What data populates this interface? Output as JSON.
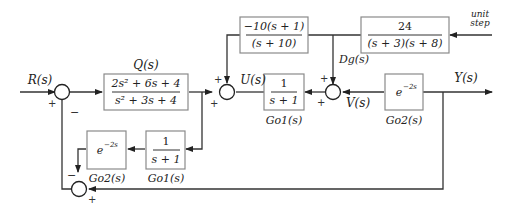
{
  "blocks": {
    "Q": {
      "label": "Q(s)",
      "num": "2s² + 6s + 4",
      "den": "s² + 3s + 4"
    },
    "K": {
      "num": "−10(s + 1)",
      "den": "(s + 10)"
    },
    "D": {
      "num": "24",
      "den": "(s + 3)(s + 8)"
    },
    "Go1_main": {
      "num": "1",
      "den": "s + 1",
      "label": "Go1(s)"
    },
    "Go2_main": {
      "expr": "e^{−2s}",
      "base": "e",
      "exp": "−2s",
      "label": "Go2(s)"
    },
    "Go1_model": {
      "num": "1",
      "den": "s + 1",
      "label": "Go1(s)"
    },
    "Go2_model": {
      "expr": "e^{−2s}",
      "base": "e",
      "exp": "−2s",
      "label": "Go2(s)"
    }
  },
  "signals": {
    "input": "R(s)",
    "control": "U(s)",
    "disturbance": "Dg(s)",
    "internal": "V(s)",
    "output": "Y(s)",
    "disturbance_source_line1": "unit",
    "disturbance_source_line2": "step"
  },
  "summing_junctions": {
    "S1": {
      "signs": [
        "+",
        "−"
      ]
    },
    "S2": {
      "signs": [
        "+",
        "+"
      ]
    },
    "S3": {
      "signs": [
        "+",
        "+"
      ]
    },
    "S4": {
      "signs": [
        "−",
        "+"
      ]
    }
  }
}
